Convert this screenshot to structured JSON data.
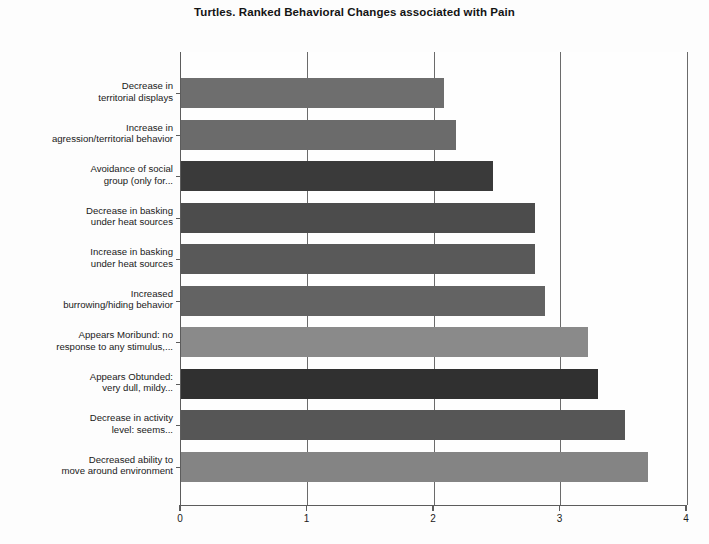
{
  "chart_data": {
    "type": "bar",
    "orientation": "horizontal",
    "title": "Turtles. Ranked Behavioral Changes associated with Pain",
    "xlabel": "",
    "ylabel": "",
    "xlim": [
      0,
      4
    ],
    "xticks": [
      "0",
      "1",
      "2",
      "3",
      "4"
    ],
    "grid": true,
    "legend": "none",
    "categories": [
      "Decrease in territorial displays",
      "Increase in agression/territorial behavior",
      "Avoidance of social group (only for...",
      "Decrease in basking under heat sources",
      "Increase in basking under heat sources",
      "Increased burrowing/hiding behavior",
      "Appears Moribund: no response to any stimulus,...",
      "Appears Obtunded: very dull, mildy...",
      "Decrease in activity level: seems...",
      "Decreased ability to move around environment"
    ],
    "category_lines": [
      [
        "Decrease in",
        "territorial displays"
      ],
      [
        "Increase in",
        "agression/territorial behavior"
      ],
      [
        "Avoidance of social",
        "group (only for..."
      ],
      [
        "Decrease in basking",
        "under heat sources"
      ],
      [
        "Increase in basking",
        "under heat sources"
      ],
      [
        "Increased",
        "burrowing/hiding behavior"
      ],
      [
        "Appears Moribund: no",
        "response to any stimulus,..."
      ],
      [
        "Appears Obtunded:",
        "very dull, mildy..."
      ],
      [
        "Decrease in activity",
        "level: seems..."
      ],
      [
        "Decreased ability to",
        "move around environment"
      ]
    ],
    "values": [
      2.08,
      2.17,
      2.47,
      2.8,
      2.8,
      2.88,
      3.22,
      3.3,
      3.51,
      3.69
    ],
    "bar_colors": [
      "#6e6e6e",
      "#6b6b6b",
      "#3a3a3a",
      "#4c4c4c",
      "#595959",
      "#636363",
      "#8a8a8a",
      "#303030",
      "#565656",
      "#848484"
    ]
  },
  "axis_style": {
    "axis_color": "#5c5c5c",
    "grid_color": "#6b6b6b",
    "plot_background": "#fefefe",
    "text_color": "#1a1a1a"
  }
}
